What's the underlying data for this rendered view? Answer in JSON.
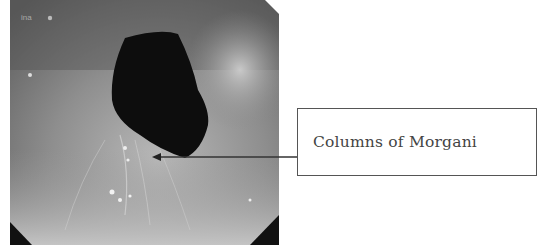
{
  "figure": {
    "photo": {
      "description": "Endoscopic grayscale view of anal canal",
      "corner_text": "ina"
    },
    "callout": {
      "label": "Columns of Morgani",
      "border_color": "#555555",
      "text_color": "#444444"
    },
    "arrow": {
      "from": [
        297,
        157
      ],
      "to": [
        152,
        157
      ],
      "color": "#333333"
    }
  }
}
